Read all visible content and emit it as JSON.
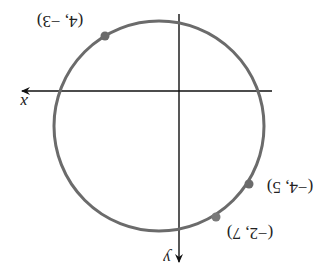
{
  "diagram": {
    "orientation": "rotated 180 degrees",
    "axes": {
      "x_label": "x",
      "y_label": "y"
    },
    "circle": {
      "stroke_color": "#6b6b6b"
    },
    "points": [
      {
        "label": "(4, −3)"
      },
      {
        "label": "(−4, 5)"
      },
      {
        "label": "(−2, 7)"
      }
    ],
    "colors": {
      "axis": "#111111",
      "circle": "#6b6b6b",
      "point": "#6b6b6b"
    }
  }
}
